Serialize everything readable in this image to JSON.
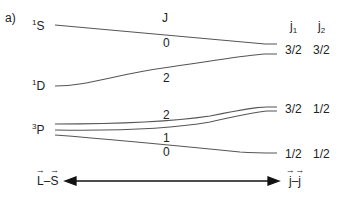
{
  "panel_label": "a)",
  "left_states": [
    {
      "sup": "1",
      "letter": "S"
    },
    {
      "sup": "1",
      "letter": "D"
    },
    {
      "sup": "3",
      "letter": "P"
    }
  ],
  "J_header": "J",
  "J_values": {
    "s0": "0",
    "d2": "2",
    "p2": "2",
    "p1": "1",
    "p0": "0"
  },
  "right_headers": {
    "j1": "j",
    "j1_sub": "1",
    "j2": "j",
    "j2_sub": "2"
  },
  "right_levels": [
    {
      "j1": "3/2",
      "j2": "3/2"
    },
    {
      "j1": "3/2",
      "j2": "1/2"
    },
    {
      "j1": "1/2",
      "j2": "1/2"
    }
  ],
  "axis": {
    "left_a": "L",
    "left_sep": "–",
    "left_b": "S",
    "right_a": "j",
    "right_sep": "–",
    "right_b": "j"
  },
  "colors": {
    "line": "#555555",
    "text": "#222222"
  }
}
